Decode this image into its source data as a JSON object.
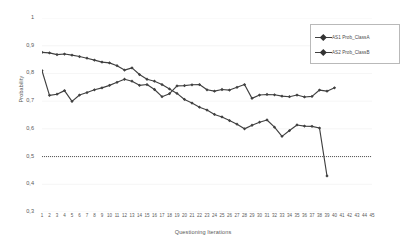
{
  "chart_data": {
    "type": "line",
    "title": "",
    "xlabel": "Questioning Iterations",
    "ylabel": "Probability",
    "xlim": [
      1,
      45
    ],
    "ylim": [
      0.3,
      1.0
    ],
    "grid": true,
    "legend_position": "top-right",
    "y_ticks": [
      "0,3",
      "0,4",
      "0,5",
      "0,6",
      "0,7",
      "0,8",
      "0,9",
      "1"
    ],
    "y_tick_values": [
      0.3,
      0.4,
      0.5,
      0.6,
      0.7,
      0.8,
      0.9,
      1.0
    ],
    "x_ticks": [
      "1",
      "2",
      "3",
      "4",
      "5",
      "6",
      "7",
      "8",
      "9",
      "10",
      "11",
      "12",
      "13",
      "14",
      "15",
      "16",
      "17",
      "18",
      "19",
      "20",
      "21",
      "22",
      "23",
      "24",
      "25",
      "26",
      "27",
      "28",
      "29",
      "30",
      "31",
      "32",
      "33",
      "34",
      "35",
      "36",
      "37",
      "38",
      "39",
      "40",
      "41",
      "42",
      "43",
      "44",
      "45"
    ],
    "annotations": [
      {
        "type": "horizontal-reference-line",
        "value": 0.5,
        "style": "dotted",
        "label": ""
      }
    ],
    "series": [
      {
        "name": "AS1 Prob_ClassA",
        "color": "#404040",
        "marker": "diamond",
        "x": [
          1,
          2,
          3,
          4,
          5,
          6,
          7,
          8,
          9,
          10,
          11,
          12,
          13,
          14,
          15,
          16,
          17,
          18,
          19,
          20,
          21,
          22,
          23,
          24,
          25,
          26,
          27,
          28,
          29,
          30,
          31,
          32,
          33,
          34,
          35,
          36,
          37,
          38,
          39
        ],
        "values": [
          0.876,
          0.874,
          0.868,
          0.87,
          0.866,
          0.861,
          0.855,
          0.848,
          0.841,
          0.838,
          0.828,
          0.812,
          0.82,
          0.796,
          0.779,
          0.772,
          0.76,
          0.744,
          0.728,
          0.706,
          0.693,
          0.678,
          0.668,
          0.652,
          0.643,
          0.63,
          0.617,
          0.6,
          0.613,
          0.624,
          0.632,
          0.606,
          0.573,
          0.594,
          0.614,
          0.61,
          0.609,
          0.603,
          0.43
        ]
      },
      {
        "name": "AS2 Prob_ClassB",
        "color": "#404040",
        "marker": "diamond",
        "x": [
          1,
          2,
          3,
          4,
          5,
          6,
          7,
          8,
          9,
          10,
          11,
          12,
          13,
          14,
          15,
          16,
          17,
          18,
          19,
          20,
          21,
          22,
          23,
          24,
          25,
          26,
          27,
          28,
          29,
          30,
          31,
          32,
          33,
          34,
          35,
          36,
          37,
          38,
          39,
          40
        ],
        "values": [
          0.81,
          0.721,
          0.725,
          0.738,
          0.699,
          0.722,
          0.731,
          0.741,
          0.748,
          0.757,
          0.768,
          0.779,
          0.772,
          0.757,
          0.76,
          0.742,
          0.716,
          0.727,
          0.755,
          0.756,
          0.759,
          0.76,
          0.741,
          0.736,
          0.742,
          0.74,
          0.75,
          0.76,
          0.71,
          0.722,
          0.724,
          0.723,
          0.718,
          0.716,
          0.722,
          0.715,
          0.717,
          0.74,
          0.736,
          0.748
        ]
      }
    ]
  },
  "legend": {
    "items": [
      {
        "label": "AS1 Prob_ClassA"
      },
      {
        "label": "AS2 Prob_ClassB"
      }
    ]
  }
}
